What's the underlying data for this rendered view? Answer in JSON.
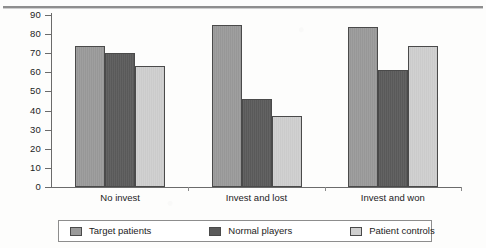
{
  "chart_data": {
    "type": "bar",
    "title": "",
    "subtitle": "",
    "xlabel": "",
    "ylabel": "",
    "categories": [
      "No invest",
      "Invest and lost",
      "Invest and won"
    ],
    "series": [
      {
        "name": "Target patients",
        "values": [
          74,
          85,
          83.5
        ],
        "color": "#9a9a9a"
      },
      {
        "name": "Normal players",
        "values": [
          70,
          46,
          61
        ],
        "color": "#5b5b5b"
      },
      {
        "name": "Patient controls",
        "values": [
          63.5,
          37,
          74
        ],
        "color": "#cfcfcf"
      }
    ],
    "ylim": [
      0,
      90
    ],
    "yticks": [
      0,
      10,
      20,
      30,
      40,
      50,
      60,
      70,
      80,
      90
    ],
    "ytick_labels": [
      "0",
      "10",
      "20",
      "30",
      "40",
      "50",
      "60",
      "70",
      "80",
      "90"
    ],
    "grid": false,
    "legend_position": "bottom",
    "orientation": "vertical",
    "grouping": "clustered"
  },
  "legend": {
    "items": [
      {
        "label": "Target patients",
        "color": "#9a9a9a"
      },
      {
        "label": "Normal players",
        "color": "#5b5b5b"
      },
      {
        "label": "Patient controls",
        "color": "#cfcfcf"
      }
    ]
  },
  "axes": {
    "y_labels": [
      "90",
      "80",
      "70",
      "60",
      "50",
      "40",
      "30",
      "20",
      "10",
      "0"
    ],
    "x_labels": [
      "No invest",
      "Invest and lost",
      "Invest and won"
    ]
  }
}
